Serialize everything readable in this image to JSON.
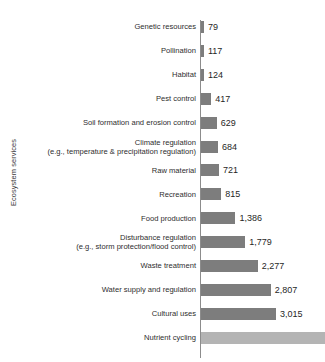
{
  "chart_data": {
    "type": "bar",
    "orientation": "horizontal",
    "title": "",
    "xlabel": "",
    "ylabel": "Ecosystem services",
    "grid": false,
    "legend": false,
    "axis_line": true,
    "value_labels": true,
    "xlim": [
      0,
      5000
    ],
    "note": "Last bar (Nutrient cycling) is cut off by the image edge and has no visible value label",
    "categories": [
      "Genetic resources",
      "Pollination",
      "Habitat",
      "Pest control",
      "Soil formation and erosion control",
      "Climate regulation\n(e.g., temperature & precipitation regulation)",
      "Raw material",
      "Recreation",
      "Food production",
      "Disturbance regulation\n(e.g., storm protection/flood control)",
      "Waste treatment",
      "Water supply and regulation",
      "Cultural uses",
      "Nutrient cycling"
    ],
    "values": [
      79,
      117,
      124,
      417,
      629,
      684,
      721,
      815,
      1386,
      1779,
      2277,
      2807,
      3015,
      5000
    ],
    "value_labels_text": [
      "79",
      "117",
      "124",
      "417",
      "629",
      "684",
      "721",
      "815",
      "1,386",
      "1,779",
      "2,277",
      "2,807",
      "3,015",
      ""
    ]
  },
  "style": {
    "bar_color": "#7d7d7d",
    "bar_color_last": "#b4b4b4",
    "axis_color": "#8c8c8c",
    "label_color": "#2e2e2e",
    "value_color": "#1f1f1f",
    "background": "#ffffff"
  }
}
